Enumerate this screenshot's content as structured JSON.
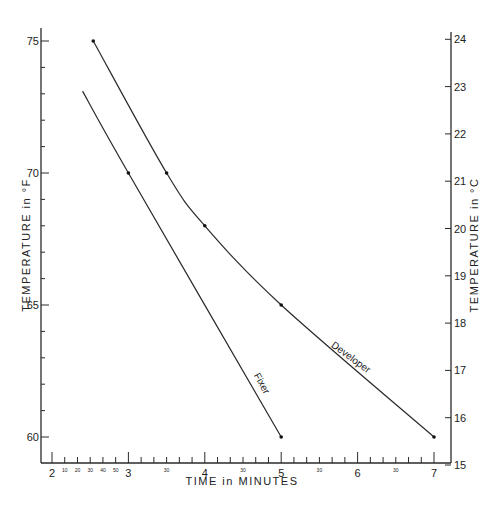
{
  "chart_data": {
    "type": "line",
    "title": "",
    "xlabel": "TIME in MINUTES",
    "ylabel": "TEMPERATURE in °F",
    "ylabel_right": "TEMPERATURE in °C",
    "xlim": [
      1.5,
      7.2
    ],
    "ylim": [
      58.9,
      75.5
    ],
    "ylim_right": [
      15,
      24
    ],
    "grid": false,
    "legend": "inline labels on curves",
    "x_major_ticks": [
      2,
      3,
      4,
      5,
      6,
      7
    ],
    "x_major_tick_labels": [
      "2",
      "3",
      "4",
      "5",
      "6",
      "7"
    ],
    "x_minor_tick_labels_between_2_and_3": [
      "10",
      "20",
      "30",
      "40",
      "50"
    ],
    "x_minor_mid_label": "30",
    "y_left_ticks": [
      60,
      65,
      70,
      75
    ],
    "y_left_tick_labels": [
      "60",
      "65",
      "70",
      "75"
    ],
    "y_right_ticks": [
      15,
      16,
      17,
      18,
      19,
      20,
      21,
      22,
      23,
      24
    ],
    "y_right_tick_labels": [
      "15",
      "16",
      "17",
      "18",
      "19",
      "20",
      "21",
      "22",
      "23",
      "24"
    ],
    "series": [
      {
        "name": "Developer",
        "x": [
          2.54,
          3.5,
          4.0,
          5.0,
          7.0
        ],
        "y": [
          75,
          70,
          68,
          65,
          60
        ],
        "markers": true
      },
      {
        "name": "Fixer",
        "x": [
          2.4,
          3.0,
          5.0
        ],
        "y": [
          73.1,
          70,
          60
        ],
        "markers": [
          false,
          true,
          true
        ]
      }
    ]
  },
  "labels": {
    "xlabel": "TIME in MINUTES",
    "ylabel_left": "TEMPERATURE in °F",
    "ylabel_right": "TEMPERATURE in °C",
    "developer": "Developer",
    "fixer": "Fixer"
  }
}
